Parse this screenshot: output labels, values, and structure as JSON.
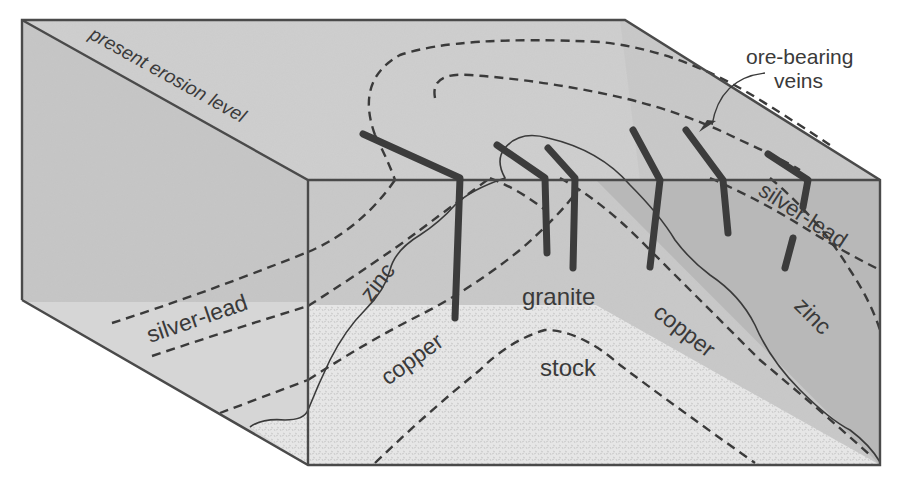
{
  "diagram": {
    "type": "block diagram of zoned ore deposits around a granite stock",
    "colors": {
      "background": "#ffffff",
      "top_face": "#cfcfcf",
      "left_face": "#c6c6c6",
      "front_face": "#c9c9c9",
      "right_face_shade": "#b7b7b7",
      "granite": "#e4e4e4",
      "edge": "#4a4a4a",
      "vein": "#3c3c3c",
      "text": "#3a3a3a"
    },
    "labels": {
      "erosion": "present erosion level",
      "ore_line1": "ore-bearing",
      "ore_line2": "veins",
      "silver_lead_left": "silver-lead",
      "zinc_left": "zinc",
      "granite": "granite",
      "copper_left": "copper",
      "stock": "stock",
      "copper_right": "copper",
      "silver_lead_right": "silver-lead",
      "zinc_right": "zinc"
    }
  }
}
